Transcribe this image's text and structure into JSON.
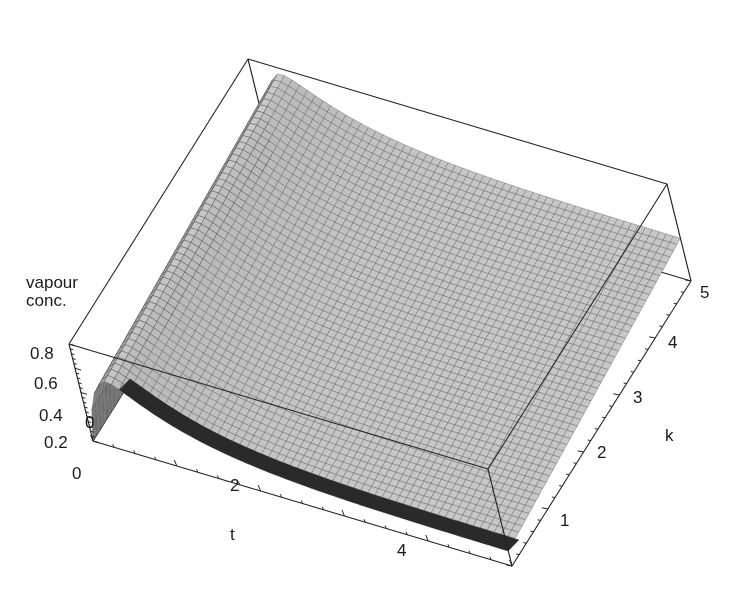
{
  "chart_data": {
    "type": "surface3d",
    "title": "",
    "axes": {
      "x": {
        "label": "t",
        "range": [
          0,
          5
        ],
        "ticks": [
          "0",
          "2",
          "4"
        ]
      },
      "y": {
        "label": "k",
        "range": [
          0,
          5
        ],
        "ticks": [
          "1",
          "2",
          "3",
          "4",
          "5"
        ]
      },
      "z": {
        "label_line1": "vapour",
        "label_line2": "conc.",
        "range": [
          0,
          0.8
        ],
        "ticks": [
          "0",
          "0.2",
          "0.4",
          "0.6",
          "0.8"
        ]
      }
    },
    "sample_points": [
      {
        "t": 0.0,
        "k": 0,
        "z": 0.0
      },
      {
        "t": 0.5,
        "k": 0,
        "z": 0.6
      },
      {
        "t": 5.0,
        "k": 0,
        "z": 0.12
      },
      {
        "t": 0.0,
        "k": 5,
        "z": 0.0
      },
      {
        "t": 0.5,
        "k": 5,
        "z": 0.8
      },
      {
        "t": 5.0,
        "k": 5,
        "z": 0.35
      }
    ],
    "mesh": {
      "style": "wireframe-shaded",
      "color": "#b8b8b8",
      "line_color": "#555555",
      "underside_color": "#2a2a2a"
    },
    "box": true,
    "grid": false,
    "legend": null
  }
}
